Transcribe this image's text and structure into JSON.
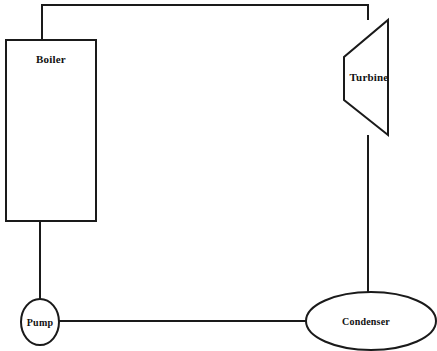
{
  "diagram": {
    "background_color": "#ffffff",
    "line_color": "#1a1a1a",
    "canvas": {
      "width": 437,
      "height": 351
    },
    "components": [
      {
        "id": "boiler",
        "label": "Boiler",
        "shape": "rectangle",
        "x": 6,
        "y": 40,
        "width": 90,
        "height": 181,
        "label_x": 51,
        "label_y": 59
      },
      {
        "id": "turbine",
        "label": "Turbine",
        "shape": "trapezoid",
        "points": "388,20 388,135 344,100 344,57",
        "label_x": 369,
        "label_y": 77
      },
      {
        "id": "pump",
        "label": "Pump",
        "shape": "ellipse",
        "cx": 40,
        "cy": 322,
        "rx": 19,
        "ry": 23,
        "label_x": 40,
        "label_y": 322
      },
      {
        "id": "condenser",
        "label": "Condenser",
        "shape": "ellipse",
        "cx": 371,
        "cy": 321,
        "rx": 65,
        "ry": 29,
        "label_x": 366,
        "label_y": 321
      }
    ],
    "pipes": [
      {
        "id": "boiler-to-turbine",
        "from": "boiler",
        "to": "turbine",
        "path": "M 42,40 L 42,5 L 368,5 L 368,20"
      },
      {
        "id": "turbine-to-condenser",
        "from": "turbine",
        "to": "condenser",
        "path": "M 368,135 L 368,293"
      },
      {
        "id": "condenser-to-pump",
        "from": "condenser",
        "to": "pump",
        "path": "M 306,321 L 59,321"
      },
      {
        "id": "pump-to-boiler",
        "from": "pump",
        "to": "boiler",
        "path": "M 40,299 L 40,221"
      }
    ]
  }
}
